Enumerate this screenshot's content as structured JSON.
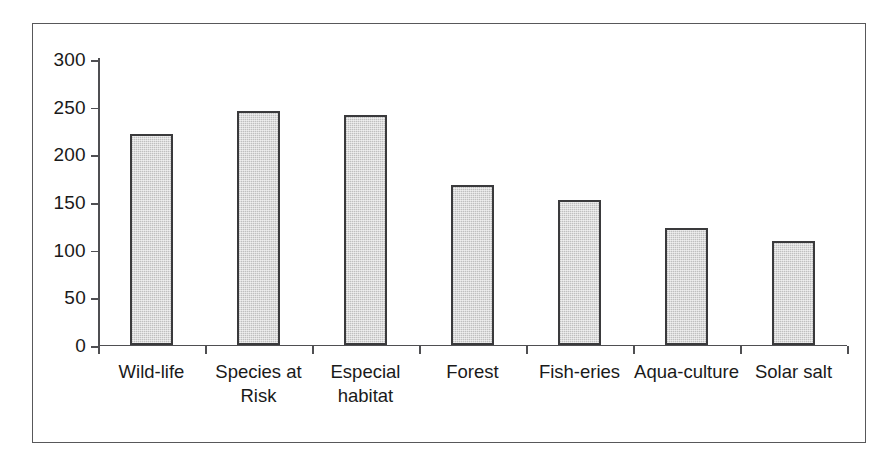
{
  "chart_data": {
    "type": "bar",
    "title": "",
    "subtitle": "",
    "xlabel": "",
    "ylabel": "",
    "categories": [
      "Wild-life",
      "Species at Risk",
      "Especial habitat",
      "Forest",
      "Fish-eries",
      "Aqua-culture",
      "Solar salt"
    ],
    "values": [
      221,
      245,
      241,
      167,
      152,
      122,
      109
    ],
    "ylim": [
      0,
      300
    ],
    "yticks": [
      0,
      50,
      100,
      150,
      200,
      250,
      300
    ],
    "ytick_labels": [
      "0",
      "50",
      "100",
      "150",
      "200",
      "250",
      "300"
    ],
    "grid": false,
    "legend": null,
    "bar_fill_color": "#c9c9c9",
    "bar_border_color": "#3a3a3c",
    "axis_color": "#4f4f52",
    "frame_color": "#58585a",
    "background_color": "#ffffff"
  }
}
